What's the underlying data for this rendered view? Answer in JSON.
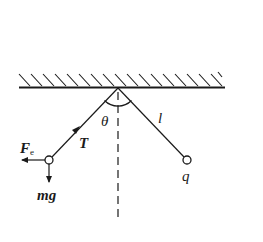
{
  "diagram": {
    "type": "physics-free-body",
    "ceiling": {
      "label": "",
      "hatched": true
    },
    "angle_label": "θ",
    "string_length_label": "l",
    "right_ball_label": "q",
    "forces": {
      "tension": {
        "label": "T"
      },
      "electric": {
        "label": "F",
        "subscript": "e"
      },
      "gravity": {
        "label": "mg"
      }
    },
    "colors": {
      "stroke": "#1a1a1a",
      "background": "#ffffff"
    }
  }
}
